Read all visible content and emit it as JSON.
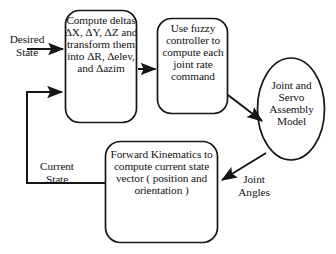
{
  "diagram": {
    "stroke_color": "#151515",
    "background_color": "#ffffff",
    "nodes": [
      {
        "id": "compute-deltas",
        "shape": "rounded-rectangle",
        "text": "Compute deltas ΔX, ΔY, ΔZ and transform them into ΔR, Δelev, and Δazim"
      },
      {
        "id": "fuzzy-controller",
        "shape": "rounded-rectangle",
        "text": "Use fuzzy controller to compute each joint rate command"
      },
      {
        "id": "joint-servo-assembly",
        "shape": "ellipse",
        "text": "Joint and Servo Assembly Model"
      },
      {
        "id": "forward-kinematics",
        "shape": "rounded-rectangle",
        "text": "Forward Kinematics to compute current state vector ( position and orientation )"
      }
    ],
    "edge_labels": [
      {
        "id": "desired-state",
        "text": "Desired State"
      },
      {
        "id": "current-state",
        "text": "Current State"
      },
      {
        "id": "joint-angles",
        "text": "Joint Angles"
      }
    ]
  }
}
